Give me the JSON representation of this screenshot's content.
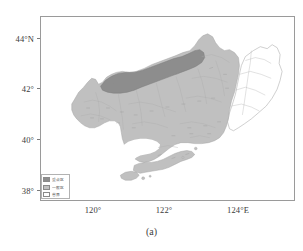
{
  "figure": {
    "caption": "(a)",
    "type": "choropleth-map",
    "region_name": "Liaoning Province"
  },
  "axes": {
    "y_ticks": [
      {
        "label": "44°N",
        "value": 44
      },
      {
        "label": "42°",
        "value": 42
      },
      {
        "label": "40°",
        "value": 40
      },
      {
        "label": "38°",
        "value": 38
      }
    ],
    "x_ticks": [
      {
        "label": "120°",
        "value": 120
      },
      {
        "label": "122°",
        "value": 122
      },
      {
        "label": "124°E",
        "value": 124
      }
    ],
    "xlim": [
      118.3,
      126.0
    ],
    "ylim": [
      37.6,
      44.7
    ]
  },
  "legend": {
    "items": [
      {
        "label": "重点区",
        "color": "#8d8d8d"
      },
      {
        "label": "一般区",
        "color": "#c0c0c0"
      },
      {
        "label": "省界",
        "color": "#ffffff"
      }
    ]
  },
  "colors": {
    "region_dark": "#8d8d8d",
    "region_light": "#c0c0c0",
    "region_blank": "#ffffff",
    "outline": "#9a9a9a",
    "frame": "#9a9a9a",
    "text": "#3a3a3a"
  }
}
